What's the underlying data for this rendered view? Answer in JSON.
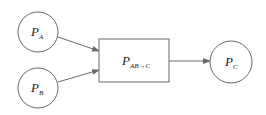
{
  "diagram": {
    "nodes": [
      {
        "id": "PA",
        "shape": "circle",
        "main": "P",
        "sub": "A"
      },
      {
        "id": "PB",
        "shape": "circle",
        "main": "P",
        "sub": "B"
      },
      {
        "id": "PABC",
        "shape": "rectangle",
        "main": "P",
        "sub": "AB→C"
      },
      {
        "id": "PC",
        "shape": "circle",
        "main": "P",
        "sub": "C"
      }
    ],
    "edges": [
      {
        "from": "PA",
        "to": "PABC"
      },
      {
        "from": "PB",
        "to": "PABC"
      },
      {
        "from": "PABC",
        "to": "PC"
      }
    ],
    "colors": {
      "stroke": "#6a6a6a",
      "text": "#222222",
      "background": "#ffffff"
    }
  }
}
